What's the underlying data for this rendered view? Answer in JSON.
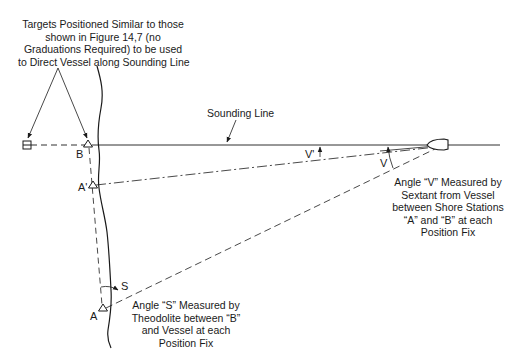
{
  "diagram": {
    "target_note": {
      "lines": [
        "Targets Positioned Similar to those",
        "shown in Figure 14,7 (no",
        "Graduations Required) to be used",
        "to Direct Vessel along Sounding Line"
      ]
    },
    "sounding_line_label": "Sounding Line",
    "points": {
      "B": "B",
      "A_prime": "A'",
      "A": "A"
    },
    "angles": {
      "V": "V",
      "V_prime": "V'",
      "S": "S"
    },
    "angle_v_note": {
      "lines": [
        "Angle “V” Measured by",
        "Sextant from Vessel",
        "between Shore Stations",
        "“A” and “B” at each",
        "Position Fix"
      ]
    },
    "angle_s_note": {
      "lines": [
        "Angle “S” Measured by",
        "Theodolite between “B”",
        "and Vessel at each",
        "Position Fix"
      ]
    },
    "colors": {
      "line": "#1a1a1a",
      "background": "#ffffff"
    }
  }
}
